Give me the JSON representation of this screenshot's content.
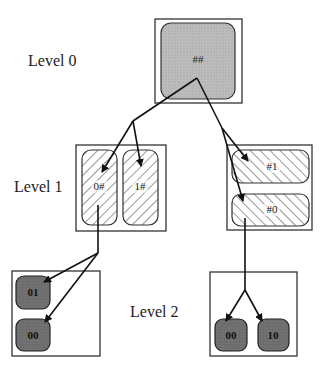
{
  "diagram": {
    "levels": [
      {
        "label": "Level 0"
      },
      {
        "label": "Level 1"
      },
      {
        "label": "Level 2"
      }
    ],
    "level0": {
      "root": {
        "label": "##",
        "style": "light-gray-dotted"
      }
    },
    "level1": {
      "left_group": {
        "nodes": [
          {
            "label": "0#",
            "style": "hatched-backslash"
          },
          {
            "label": "1#",
            "style": "hatched-backslash"
          }
        ]
      },
      "right_group": {
        "nodes": [
          {
            "label": "#1",
            "style": "hatched-slash"
          },
          {
            "label": "#0",
            "style": "hatched-slash"
          }
        ]
      }
    },
    "level2": {
      "left_group": {
        "nodes": [
          {
            "label": "01",
            "style": "dark-gray"
          },
          {
            "label": "00",
            "style": "dark-gray"
          }
        ]
      },
      "right_group": {
        "nodes": [
          {
            "label": "00",
            "style": "dark-gray"
          },
          {
            "label": "10",
            "style": "dark-gray"
          }
        ]
      }
    },
    "edges": [
      {
        "from": "##",
        "to": "0#"
      },
      {
        "from": "##",
        "to": "1#"
      },
      {
        "from": "##",
        "to": "#1"
      },
      {
        "from": "##",
        "to": "#0"
      },
      {
        "from": "0#",
        "to": "01"
      },
      {
        "from": "0#",
        "to": "00"
      },
      {
        "from": "#0",
        "to": "00"
      },
      {
        "from": "#0",
        "to": "10"
      }
    ],
    "colors": {
      "root_fill": "#b8b8b8",
      "leaf_fill": "#6a6a6a",
      "hatch_stroke": "#333333",
      "frame_stroke": "#333333"
    }
  }
}
